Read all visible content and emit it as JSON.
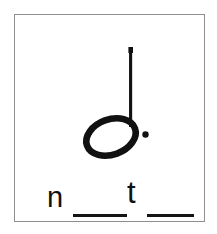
{
  "card": {
    "title": "music-note-word-blank-card",
    "border_color": "#8d8f92",
    "background_color": "#ffffff",
    "ink_color": "#111111"
  },
  "notation": {
    "symbol_name": "dotted-half-note",
    "notehead": "hollow-ellipse",
    "stem": "up",
    "augmentation_dot": "•",
    "dot_count": 1
  },
  "word_puzzle": {
    "pattern": "n__t__",
    "letters": [
      {
        "name": "n",
        "char": "n"
      },
      {
        "name": "t",
        "char": "t"
      }
    ],
    "blanks": [
      {
        "name": "blank-1",
        "char": "__"
      },
      {
        "name": "blank-2",
        "char": "__"
      }
    ]
  }
}
